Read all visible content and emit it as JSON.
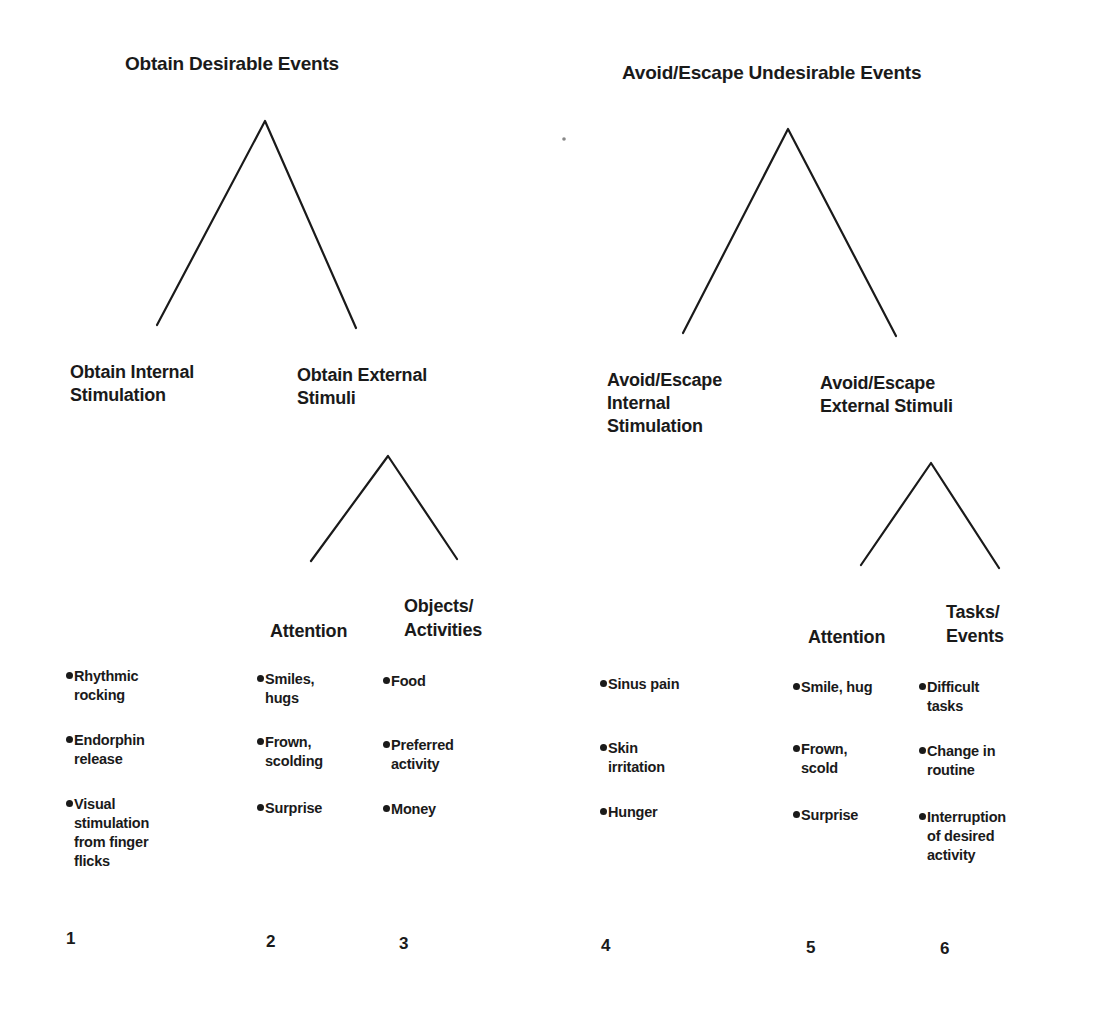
{
  "roots": {
    "left": "Obtain Desirable Events",
    "right": "Avoid/Escape Undesirable Events"
  },
  "branches": {
    "obtain_internal": "Obtain Internal\nStimulation",
    "obtain_external": "Obtain External\nStimuli",
    "avoid_internal": "Avoid/Escape\nInternal\nStimulation",
    "avoid_external": "Avoid/Escape\nExternal Stimuli"
  },
  "categories": {
    "obtain_attention": "Attention",
    "obtain_objects": "Objects/\nActivities",
    "avoid_attention": "Attention",
    "avoid_tasks": "Tasks/\nEvents"
  },
  "columns": [
    {
      "number": "1",
      "items": [
        "Rhythmic\nrocking",
        "Endorphin\nrelease",
        "Visual\nstimulation\nfrom finger\nflicks"
      ]
    },
    {
      "number": "2",
      "items": [
        "Smiles,\nhugs",
        "Frown,\nscolding",
        "Surprise"
      ]
    },
    {
      "number": "3",
      "items": [
        "Food",
        "Preferred\nactivity",
        "Money"
      ]
    },
    {
      "number": "4",
      "items": [
        "Sinus pain",
        "Skin\nirritation",
        "Hunger"
      ]
    },
    {
      "number": "5",
      "items": [
        "Smile, hug",
        "Frown,\nscold",
        "Surprise"
      ]
    },
    {
      "number": "6",
      "items": [
        "Difficult\ntasks",
        "Change in\nroutine",
        "Interruption\nof desired\nactivity"
      ]
    }
  ],
  "colors": {
    "ink": "#1a1a1a",
    "background": "#ffffff"
  }
}
